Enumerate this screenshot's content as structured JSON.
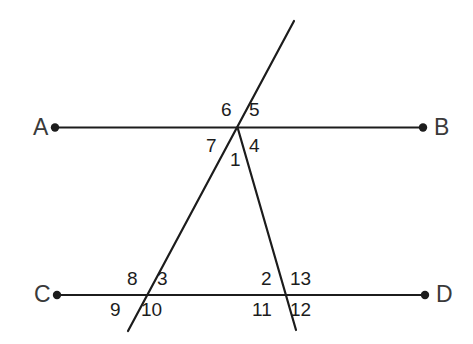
{
  "figure": {
    "type": "geometry-diagram",
    "background_color": "#ffffff",
    "line_color": "#1c1c1c",
    "label_color": "#1c1c1c",
    "point_label_color": "#3a3a3a",
    "stroke_width": 2.2
  },
  "points": [
    {
      "name": "A",
      "label": "A",
      "label_x": 33,
      "label_y": 116,
      "dot_x": 55,
      "dot_y": 127.5,
      "dot_r": 4.2
    },
    {
      "name": "B",
      "label": "B",
      "label_x": 434,
      "label_y": 116,
      "dot_x": 423,
      "dot_y": 127.5,
      "dot_r": 4.2
    },
    {
      "name": "C",
      "label": "C",
      "label_x": 34,
      "label_y": 283,
      "dot_x": 57,
      "dot_y": 295,
      "dot_r": 4.2
    },
    {
      "name": "D",
      "label": "D",
      "label_x": 436,
      "label_y": 283,
      "dot_x": 425,
      "dot_y": 295,
      "dot_r": 4.2
    }
  ],
  "lines": [
    {
      "name": "line-AB",
      "x1": 55,
      "y1": 127.5,
      "x2": 423,
      "y2": 127.5
    },
    {
      "name": "line-CD",
      "x1": 57,
      "y1": 295,
      "x2": 425,
      "y2": 295
    },
    {
      "name": "transversal-left",
      "x1": 294,
      "y1": 21,
      "x2": 128,
      "y2": 331
    },
    {
      "name": "transversal-right",
      "x1": 238,
      "y1": 129,
      "x2": 296,
      "y2": 330
    }
  ],
  "intersections": [
    {
      "name": "apex",
      "x": 238,
      "y": 129
    },
    {
      "name": "left-base",
      "x": 146,
      "y": 295
    },
    {
      "name": "right-base",
      "x": 285,
      "y": 295
    }
  ],
  "angle_labels": [
    {
      "id": "1",
      "text": "1",
      "x": 230,
      "y": 150
    },
    {
      "id": "2",
      "text": "2",
      "x": 261,
      "y": 269
    },
    {
      "id": "3",
      "text": "3",
      "x": 157,
      "y": 269
    },
    {
      "id": "4",
      "text": "4",
      "x": 249,
      "y": 136
    },
    {
      "id": "5",
      "text": "5",
      "x": 249,
      "y": 100
    },
    {
      "id": "6",
      "text": "6",
      "x": 221,
      "y": 100
    },
    {
      "id": "7",
      "text": "7",
      "x": 206,
      "y": 136
    },
    {
      "id": "8",
      "text": "8",
      "x": 127,
      "y": 269
    },
    {
      "id": "9",
      "text": "9",
      "x": 110,
      "y": 300
    },
    {
      "id": "10",
      "text": "10",
      "x": 141,
      "y": 300
    },
    {
      "id": "11",
      "text": "11",
      "x": 252,
      "y": 300
    },
    {
      "id": "12",
      "text": "12",
      "x": 290,
      "y": 300
    },
    {
      "id": "13",
      "text": "13",
      "x": 290,
      "y": 269
    }
  ]
}
